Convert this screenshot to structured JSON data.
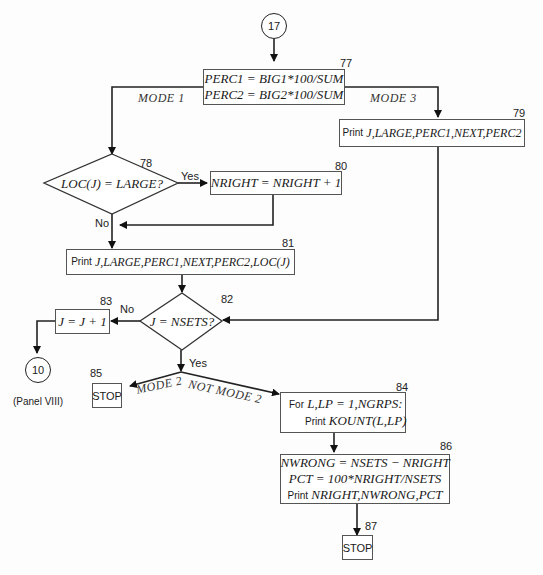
{
  "connectors": {
    "entry": "17",
    "exit": "10",
    "exit_note": "(Panel VIII)"
  },
  "nodes": {
    "n77": {
      "id": "77",
      "lines": [
        "PERC1 = BIG1*100/SUM",
        "PERC2 = BIG2*100/SUM"
      ]
    },
    "n78": {
      "id": "78",
      "text": "LOC(J) = LARGE?"
    },
    "n79": {
      "id": "79",
      "prefix": "Print",
      "text": "J,LARGE,PERC1,NEXT,PERC2"
    },
    "n80": {
      "id": "80",
      "text": "NRIGHT = NRIGHT + 1"
    },
    "n81": {
      "id": "81",
      "prefix": "Print",
      "text": "J,LARGE,PERC1,NEXT,PERC2,LOC(J)"
    },
    "n82": {
      "id": "82",
      "text": "J = NSETS?"
    },
    "n83": {
      "id": "83",
      "text": "J = J + 1"
    },
    "n84": {
      "id": "84",
      "line1_prefix": "For",
      "line1": "L,LP = 1,NGRPS:",
      "line2_prefix": "Print",
      "line2": "KOUNT(L,LP)"
    },
    "n85": {
      "id": "85",
      "text": "STOP"
    },
    "n86": {
      "id": "86",
      "line1": "NWRONG = NSETS − NRIGHT",
      "line2": "PCT = 100*NRIGHT/NSETS",
      "line3_prefix": "Print",
      "line3": "NRIGHT,NWRONG,PCT"
    },
    "n87": {
      "id": "87",
      "text": "STOP"
    }
  },
  "edge_labels": {
    "mode1": "MODE 1",
    "mode3": "MODE 3",
    "yes78": "Yes",
    "no78": "No",
    "no82": "No",
    "yes82": "Yes",
    "mode2": "MODE 2",
    "not_mode2": "NOT MODE 2"
  }
}
